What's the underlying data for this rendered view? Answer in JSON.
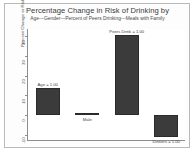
{
  "chart_data": {
    "type": "bar",
    "title": "Percentage Change in Risk of Drinking by",
    "subtitle": "Age---Gender---Percent of Peers Drinking---Meals with Family",
    "xlabel": "",
    "ylabel": "Percent Change in Risk",
    "categories": [
      "Age = 1.00",
      "Male",
      "Peers Drink = 1.00",
      "Dinners = 1.00"
    ],
    "values": [
      14,
      1,
      41,
      -11
    ],
    "ylim": [
      -13,
      44
    ],
    "yticks": [
      -10,
      0,
      10,
      20,
      30,
      40
    ],
    "ytick_labels": [
      "-10",
      "0",
      "10",
      "20",
      "30",
      "40"
    ],
    "grid": false,
    "legend": null,
    "bar_color": "#3b3b3b",
    "axis_color": "#8d8d8d",
    "label_placement": [
      "above",
      "below",
      "above",
      "below"
    ]
  }
}
